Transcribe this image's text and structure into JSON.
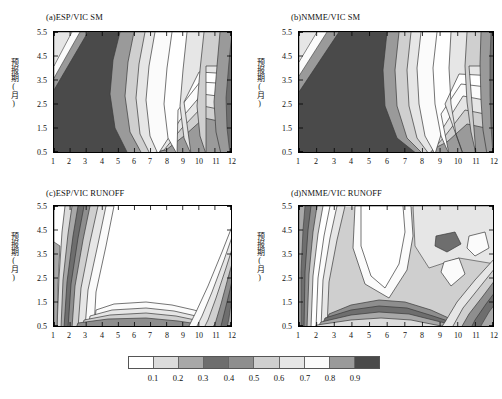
{
  "figure": {
    "width": 502,
    "height": 399,
    "background": "#ffffff"
  },
  "chart_data": {
    "type": "heatmap",
    "title": "",
    "subplot_layout": "2x2 contour panels with shared discrete grayscale colorbar",
    "xlabel": "",
    "ylabel": "预报期(月)",
    "xlim": [
      0.5,
      12.5
    ],
    "ylim": [
      0.5,
      5.5
    ],
    "xticks": [
      1,
      2,
      3,
      4,
      5,
      6,
      7,
      8,
      9,
      10,
      11,
      12
    ],
    "xticklabels": [
      "1",
      "2",
      "3",
      "4",
      "5",
      "6",
      "7",
      "8",
      "9",
      "10",
      "11",
      "12"
    ],
    "yticks": [
      0.5,
      1.5,
      2.5,
      3.5,
      4.5,
      5.5
    ],
    "yticklabels": [
      "0.5",
      "1.5",
      "2.5",
      "3.5",
      "4.5",
      "5.5"
    ],
    "grid": false,
    "legend_position": "bottom",
    "colorbar": {
      "levels": [
        0.0,
        0.1,
        0.2,
        0.3,
        0.4,
        0.5,
        0.6,
        0.7,
        0.8,
        0.9,
        1.0
      ],
      "ticklabels": [
        "0.1",
        "0.2",
        "0.3",
        "0.4",
        "0.5",
        "0.6",
        "0.7",
        "0.8",
        "0.9"
      ],
      "colors": [
        "#ffffff",
        "#dcdcdc",
        "#a8a8a8",
        "#6e6e6e",
        "#8e8e8e",
        "#cfcfcf",
        "#e6e6e6",
        "#fbfbfb",
        "#9a9a9a",
        "#4a4a4a"
      ]
    },
    "panels": [
      {
        "key": "a",
        "label": "(a)ESP/VIC SM",
        "xlabel": "",
        "ylabel": "预报期(月)",
        "description": "Band values increase from low in left/top-left region to a high-value tongue centered near month 8 spanning all lead times."
      },
      {
        "key": "b",
        "label": "(b)NMME/VIC SM",
        "xlabel": "",
        "ylabel": "预报期(月)",
        "description": "Similar to panel a with a broader high-value tongue centered near months 8-9."
      },
      {
        "key": "c",
        "label": "(c)ESP/VIC RUNOFF",
        "xlabel": "",
        "ylabel": "预报期(月)",
        "description": "High-value plateau across months 5-10 at most lead times; steep gradient bands along months 1-4 and 11-12."
      },
      {
        "key": "d",
        "label": "(d)NMME/VIC RUNOFF",
        "xlabel": "",
        "ylabel": "预报期(月)",
        "description": "High-value lobe near months 5-6 at upper lead times with isolated patches near months 9-11."
      }
    ]
  },
  "panels": {
    "a": {
      "title": "(a)ESP/VIC SM"
    },
    "b": {
      "title": "(b)NMME/VIC SM"
    },
    "c": {
      "title": "(c)ESP/VIC RUNOFF"
    },
    "d": {
      "title": "(d)NMME/VIC RUNOFF"
    }
  },
  "axis": {
    "ylabel": "预报期(月)",
    "xticklabels": [
      "1",
      "2",
      "3",
      "4",
      "5",
      "6",
      "7",
      "8",
      "9",
      "10",
      "11",
      "12"
    ],
    "yticklabels": [
      "5.5",
      "4.5",
      "3.5",
      "2.5",
      "1.5",
      "0.5"
    ]
  },
  "colorbar": {
    "ticklabels": [
      "0.1",
      "0.2",
      "0.3",
      "0.4",
      "0.5",
      "0.6",
      "0.7",
      "0.8",
      "0.9"
    ],
    "colors": [
      "#ffffff",
      "#dcdcdc",
      "#a8a8a8",
      "#6e6e6e",
      "#8e8e8e",
      "#cfcfcf",
      "#e6e6e6",
      "#fbfbfb",
      "#9a9a9a",
      "#4a4a4a"
    ]
  }
}
